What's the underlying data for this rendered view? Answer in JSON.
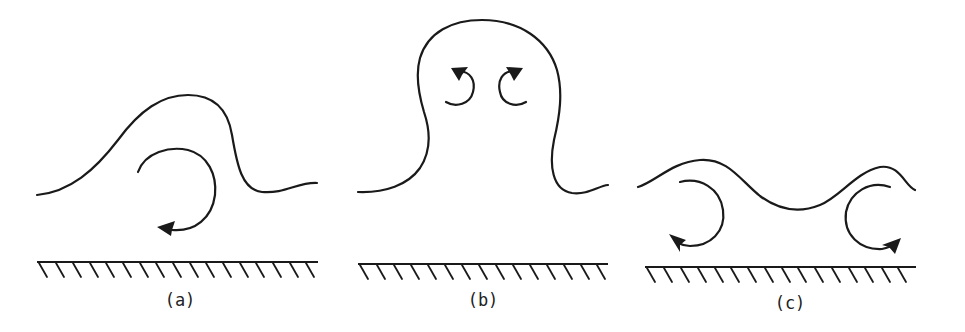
{
  "figure": {
    "stroke_color": "#1a1a1a",
    "background": "#ffffff",
    "panels": [
      {
        "id": "a",
        "label": "(a)",
        "description": "Single asymmetric bulge over a wall with one clockwise-to-left rotating vortex beneath its leading edge",
        "vortices": 1
      },
      {
        "id": "b",
        "label": "(b)",
        "description": "Mushroom-shaped ejection lifting away from the wall with a counter-rotating vortex pair in its head",
        "vortices": 2
      },
      {
        "id": "c",
        "label": "(c)",
        "description": "Wavy interface near the wall with two outward-turning vortices at either end",
        "vortices": 2
      }
    ]
  }
}
